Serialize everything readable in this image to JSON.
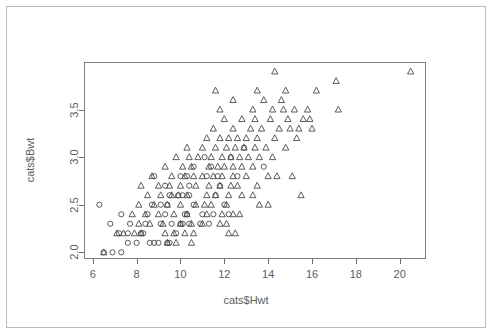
{
  "figure": {
    "background_color": "#ffffff",
    "frame_color": "#b9b9b9",
    "plot_border_color": "#7d7d7d",
    "marker_color": "#4a4a4a"
  },
  "axes": {
    "x_title": "cats$Hwt",
    "y_title": "cats$Bwt",
    "x_ticks": [
      "6",
      "8",
      "10",
      "12",
      "14",
      "16",
      "18",
      "20"
    ],
    "y_ticks": [
      "2.0",
      "2.5",
      "3.0",
      "3.5"
    ]
  },
  "chart_data": {
    "type": "scatter",
    "title": "",
    "xlabel": "cats$Hwt",
    "ylabel": "cats$Bwt",
    "xlim": [
      5.6,
      21.2
    ],
    "ylim": [
      1.93,
      4.0
    ],
    "xticks": [
      6,
      8,
      10,
      12,
      14,
      16,
      18,
      20
    ],
    "yticks": [
      2.0,
      2.5,
      3.0,
      3.5
    ],
    "grid": false,
    "legend": "none",
    "series": [
      {
        "name": "Female",
        "marker": "circle-open",
        "points": [
          [
            6.5,
            2.0
          ],
          [
            6.9,
            2.0
          ],
          [
            7.3,
            2.0
          ],
          [
            7.6,
            2.1
          ],
          [
            8.0,
            2.1
          ],
          [
            8.6,
            2.1
          ],
          [
            8.8,
            2.1
          ],
          [
            9.0,
            2.1
          ],
          [
            9.4,
            2.1
          ],
          [
            9.5,
            2.1
          ],
          [
            7.2,
            2.2
          ],
          [
            7.6,
            2.2
          ],
          [
            8.2,
            2.2
          ],
          [
            8.3,
            2.2
          ],
          [
            9.8,
            2.2
          ],
          [
            6.8,
            2.3
          ],
          [
            7.7,
            2.3
          ],
          [
            8.4,
            2.3
          ],
          [
            9.1,
            2.3
          ],
          [
            9.6,
            2.3
          ],
          [
            10.0,
            2.3
          ],
          [
            10.1,
            2.3
          ],
          [
            10.4,
            2.3
          ],
          [
            10.9,
            2.3
          ],
          [
            11.3,
            2.3
          ],
          [
            7.3,
            2.4
          ],
          [
            8.5,
            2.4
          ],
          [
            9.3,
            2.4
          ],
          [
            10.2,
            2.4
          ],
          [
            10.3,
            2.4
          ],
          [
            11.0,
            2.4
          ],
          [
            11.5,
            2.4
          ],
          [
            12.2,
            2.4
          ],
          [
            6.3,
            2.5
          ],
          [
            8.7,
            2.5
          ],
          [
            9.1,
            2.5
          ],
          [
            9.4,
            2.5
          ],
          [
            10.6,
            2.5
          ],
          [
            12.0,
            2.5
          ],
          [
            9.5,
            2.6
          ],
          [
            9.9,
            2.6
          ],
          [
            10.1,
            2.6
          ],
          [
            10.4,
            2.6
          ],
          [
            11.6,
            2.6
          ],
          [
            9.3,
            2.7
          ],
          [
            10.4,
            2.7
          ],
          [
            11.8,
            2.7
          ],
          [
            8.8,
            2.8
          ],
          [
            10.0,
            2.8
          ],
          [
            10.3,
            2.8
          ],
          [
            11.2,
            2.8
          ],
          [
            11.7,
            2.8
          ],
          [
            12.6,
            2.8
          ],
          [
            10.6,
            2.9
          ],
          [
            11.4,
            2.9
          ],
          [
            13.8,
            2.9
          ],
          [
            11.1,
            3.0
          ],
          [
            12.3,
            3.0
          ],
          [
            12.9,
            3.1
          ]
        ]
      },
      {
        "name": "Male",
        "marker": "triangle-open",
        "points": [
          [
            6.5,
            2.0
          ],
          [
            9.4,
            2.1
          ],
          [
            9.8,
            2.1
          ],
          [
            10.5,
            2.1
          ],
          [
            7.1,
            2.2
          ],
          [
            7.4,
            2.2
          ],
          [
            7.9,
            2.2
          ],
          [
            8.2,
            2.2
          ],
          [
            9.3,
            2.2
          ],
          [
            9.7,
            2.2
          ],
          [
            10.2,
            2.2
          ],
          [
            10.6,
            2.2
          ],
          [
            12.2,
            2.2
          ],
          [
            12.5,
            2.2
          ],
          [
            8.1,
            2.3
          ],
          [
            8.6,
            2.3
          ],
          [
            9.2,
            2.3
          ],
          [
            10.0,
            2.3
          ],
          [
            10.5,
            2.3
          ],
          [
            11.0,
            2.3
          ],
          [
            11.8,
            2.3
          ],
          [
            12.1,
            2.3
          ],
          [
            7.8,
            2.4
          ],
          [
            8.4,
            2.4
          ],
          [
            9.0,
            2.4
          ],
          [
            9.7,
            2.4
          ],
          [
            10.3,
            2.4
          ],
          [
            11.2,
            2.4
          ],
          [
            11.9,
            2.4
          ],
          [
            12.4,
            2.4
          ],
          [
            12.7,
            2.4
          ],
          [
            8.1,
            2.5
          ],
          [
            8.8,
            2.5
          ],
          [
            9.4,
            2.5
          ],
          [
            10.0,
            2.5
          ],
          [
            10.7,
            2.5
          ],
          [
            11.1,
            2.5
          ],
          [
            11.4,
            2.5
          ],
          [
            12.1,
            2.5
          ],
          [
            13.6,
            2.5
          ],
          [
            14.0,
            2.5
          ],
          [
            8.5,
            2.6
          ],
          [
            9.1,
            2.6
          ],
          [
            9.6,
            2.6
          ],
          [
            9.9,
            2.6
          ],
          [
            10.3,
            2.6
          ],
          [
            11.2,
            2.6
          ],
          [
            11.6,
            2.6
          ],
          [
            12.2,
            2.6
          ],
          [
            12.8,
            2.6
          ],
          [
            13.3,
            2.6
          ],
          [
            15.5,
            2.6
          ],
          [
            8.2,
            2.7
          ],
          [
            9.0,
            2.7
          ],
          [
            9.5,
            2.7
          ],
          [
            10.0,
            2.7
          ],
          [
            10.7,
            2.7
          ],
          [
            11.3,
            2.7
          ],
          [
            11.8,
            2.7
          ],
          [
            12.3,
            2.7
          ],
          [
            12.6,
            2.7
          ],
          [
            13.5,
            2.7
          ],
          [
            8.7,
            2.8
          ],
          [
            9.6,
            2.8
          ],
          [
            10.2,
            2.8
          ],
          [
            10.6,
            2.8
          ],
          [
            11.0,
            2.8
          ],
          [
            11.5,
            2.8
          ],
          [
            11.9,
            2.8
          ],
          [
            12.4,
            2.8
          ],
          [
            13.0,
            2.8
          ],
          [
            14.0,
            2.8
          ],
          [
            14.4,
            2.8
          ],
          [
            15.1,
            2.8
          ],
          [
            9.3,
            2.9
          ],
          [
            10.1,
            2.9
          ],
          [
            10.5,
            2.9
          ],
          [
            11.3,
            2.9
          ],
          [
            11.7,
            2.9
          ],
          [
            12.0,
            2.9
          ],
          [
            12.4,
            2.9
          ],
          [
            12.8,
            2.9
          ],
          [
            13.3,
            2.9
          ],
          [
            9.8,
            3.0
          ],
          [
            10.4,
            3.0
          ],
          [
            10.8,
            3.0
          ],
          [
            11.4,
            3.0
          ],
          [
            11.9,
            3.0
          ],
          [
            12.3,
            3.0
          ],
          [
            12.7,
            3.0
          ],
          [
            13.1,
            3.0
          ],
          [
            13.6,
            3.0
          ],
          [
            14.2,
            3.0
          ],
          [
            10.3,
            3.1
          ],
          [
            11.0,
            3.1
          ],
          [
            11.6,
            3.1
          ],
          [
            12.1,
            3.1
          ],
          [
            12.5,
            3.1
          ],
          [
            12.9,
            3.1
          ],
          [
            13.4,
            3.1
          ],
          [
            13.9,
            3.1
          ],
          [
            14.8,
            3.1
          ],
          [
            11.2,
            3.2
          ],
          [
            11.8,
            3.2
          ],
          [
            12.2,
            3.2
          ],
          [
            12.6,
            3.2
          ],
          [
            13.0,
            3.2
          ],
          [
            13.5,
            3.2
          ],
          [
            14.3,
            3.2
          ],
          [
            15.3,
            3.2
          ],
          [
            11.5,
            3.3
          ],
          [
            12.4,
            3.3
          ],
          [
            13.2,
            3.3
          ],
          [
            13.7,
            3.3
          ],
          [
            14.5,
            3.3
          ],
          [
            15.0,
            3.3
          ],
          [
            15.4,
            3.3
          ],
          [
            16.0,
            3.3
          ],
          [
            12.0,
            3.4
          ],
          [
            12.8,
            3.4
          ],
          [
            13.4,
            3.4
          ],
          [
            14.1,
            3.4
          ],
          [
            14.9,
            3.4
          ],
          [
            15.6,
            3.4
          ],
          [
            15.9,
            3.4
          ],
          [
            11.8,
            3.5
          ],
          [
            13.3,
            3.5
          ],
          [
            14.2,
            3.5
          ],
          [
            14.7,
            3.5
          ],
          [
            15.2,
            3.5
          ],
          [
            15.8,
            3.5
          ],
          [
            17.2,
            3.5
          ],
          [
            12.4,
            3.6
          ],
          [
            13.8,
            3.6
          ],
          [
            14.6,
            3.6
          ],
          [
            11.6,
            3.7
          ],
          [
            13.5,
            3.7
          ],
          [
            14.8,
            3.7
          ],
          [
            16.2,
            3.7
          ],
          [
            14.3,
            3.9
          ],
          [
            17.1,
            3.8
          ],
          [
            20.5,
            3.9
          ]
        ]
      }
    ]
  }
}
